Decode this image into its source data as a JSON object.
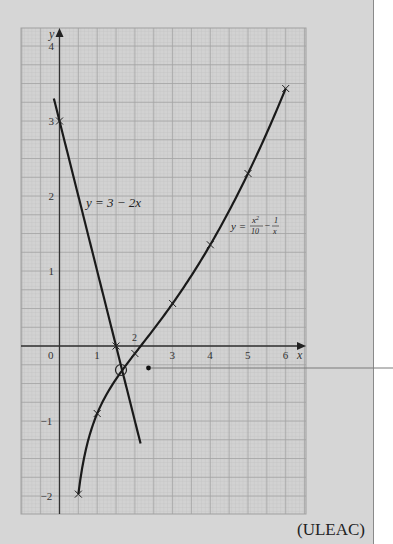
{
  "chart_data": {
    "type": "line",
    "title": "",
    "xlabel": "x",
    "ylabel": "y",
    "xlim": [
      -0.95,
      6.5
    ],
    "ylim": [
      -2.25,
      4.25
    ],
    "grid": true,
    "x_ticks": [
      "0",
      "1",
      "2",
      "3",
      "4",
      "5",
      "6"
    ],
    "y_ticks": [
      "-2",
      "-1",
      "1",
      "2",
      "3",
      "4"
    ],
    "series": [
      {
        "name": "y = 3 - 2x",
        "type": "line",
        "x": [
          -0.15,
          2.15
        ],
        "y": [
          3.3,
          -1.3
        ],
        "markers": [
          {
            "x": 0,
            "y": 3
          },
          {
            "x": 1.5,
            "y": 0
          }
        ]
      },
      {
        "name": "y = x²/10 − 1/x",
        "type": "curve",
        "x": [
          0.5,
          1,
          2,
          3,
          4,
          5,
          6
        ],
        "y": [
          -1.975,
          -0.9,
          -0.1,
          0.567,
          1.35,
          2.3,
          3.433
        ]
      }
    ],
    "annotations": [
      {
        "text": "y = 3 − 2x",
        "x": 0.65,
        "y": 1.88
      },
      {
        "text": "y = x²/10 − 1/x",
        "x": 4.45,
        "y": 1.6
      },
      {
        "text": "2",
        "x": 2.0,
        "y": 0.08
      },
      {
        "type": "circle",
        "x": 1.63,
        "y": -0.27,
        "note": "intersection point"
      },
      {
        "type": "leader-line",
        "from": [
          2.35,
          -0.28
        ],
        "to": "right margin"
      }
    ]
  },
  "labels": {
    "axis_x": "x",
    "axis_y": "y",
    "origin": "0",
    "line_label_prefix": "y = 3 − 2",
    "line_label_var": "x",
    "curve_label_y": "y =",
    "curve_num": "x",
    "curve_num_sup": "2",
    "curve_den": "10",
    "curve_minus": "−",
    "curve_frac2_num": "1",
    "curve_frac2_den": "x",
    "small_two": "2",
    "source": "(ULEAC)"
  }
}
